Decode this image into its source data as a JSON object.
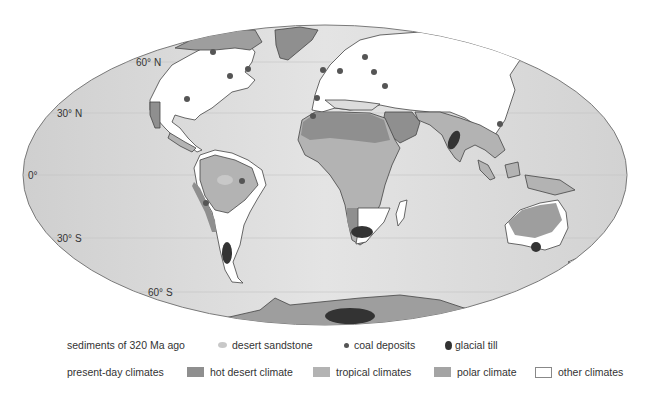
{
  "map": {
    "projection": "Mollweide world map",
    "latitude_labels": [
      {
        "label": "60° N",
        "lat": 60
      },
      {
        "label": "30° N",
        "lat": 30
      },
      {
        "label": "0°",
        "lat": 0
      },
      {
        "label": "30° S",
        "lat": -30
      },
      {
        "label": "60° S",
        "lat": -60
      }
    ],
    "colors": {
      "ocean": "#dcdcdc",
      "other_climates": "#ffffff",
      "hot_desert": "#8f8f8f",
      "tropical": "#b3b3b3",
      "polar": "#9e9e9e",
      "desert_sandstone": "#c8c8c8",
      "coal": "#555555",
      "glacial_till": "#333333",
      "coastline": "#444444"
    }
  },
  "legend": {
    "sediments": {
      "title": "sediments of 320  Ma ago",
      "items": [
        {
          "label": "desert sandstone",
          "icon": "light-dot"
        },
        {
          "label": "coal deposits",
          "icon": "small-dark-dot"
        },
        {
          "label": "glacial till",
          "icon": "dark-oval"
        }
      ]
    },
    "climates": {
      "title": "present-day climates",
      "items": [
        {
          "label": "hot desert climate",
          "icon": "dark-gray-swatch"
        },
        {
          "label": "tropical climates",
          "icon": "light-gray-swatch"
        },
        {
          "label": "polar climate",
          "icon": "mid-gray-swatch"
        },
        {
          "label": "other climates",
          "icon": "white-swatch"
        }
      ]
    }
  }
}
